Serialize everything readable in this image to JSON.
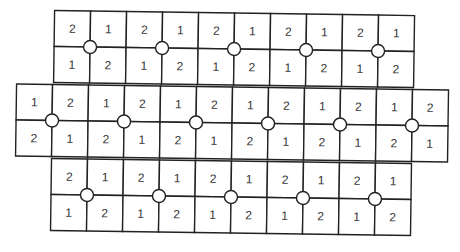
{
  "diagram": {
    "cell_size": 36,
    "rotation_deg": 0.8,
    "colors": {
      "line": "#222222",
      "text": "#333333",
      "node_fill": "#ffffff",
      "background": "#ffffff"
    },
    "blocks": [
      {
        "name": "top-block",
        "x": 53,
        "y": 13,
        "rows": [
          [
            "2",
            "1",
            "2",
            "1",
            "2",
            "1",
            "2",
            "1",
            "2",
            "1"
          ],
          [
            "1",
            "2",
            "1",
            "2",
            "1",
            "2",
            "1",
            "2",
            "1",
            "2"
          ]
        ],
        "node_columns": [
          1,
          3,
          5,
          7,
          9
        ]
      },
      {
        "name": "middle-block",
        "x": 16,
        "y": 87,
        "rows": [
          [
            "1",
            "2",
            "1",
            "2",
            "1",
            "2",
            "1",
            "2",
            "1",
            "2",
            "1",
            "2"
          ],
          [
            "2",
            "1",
            "2",
            "1",
            "2",
            "1",
            "2",
            "1",
            "2",
            "1",
            "2",
            "1"
          ]
        ],
        "node_columns": [
          1,
          3,
          5,
          7,
          9,
          11
        ]
      },
      {
        "name": "bottom-block",
        "x": 52,
        "y": 161,
        "rows": [
          [
            "2",
            "1",
            "2",
            "1",
            "2",
            "1",
            "2",
            "1",
            "2",
            "1"
          ],
          [
            "1",
            "2",
            "1",
            "2",
            "1",
            "2",
            "1",
            "2",
            "1",
            "2"
          ]
        ],
        "node_columns": [
          1,
          3,
          5,
          7,
          9
        ]
      }
    ]
  }
}
